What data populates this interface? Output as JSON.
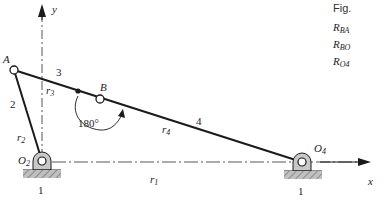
{
  "diagram": {
    "type": "four-bar linkage (vector loop)",
    "axes": {
      "x_label": "x",
      "y_label": "y"
    },
    "points": {
      "A": "A",
      "B": "B",
      "O2": {
        "base": "O",
        "sub": "2"
      },
      "O4": {
        "base": "O",
        "sub": "4"
      }
    },
    "links": {
      "ground": "1",
      "ground_right": "1",
      "crank": "2",
      "coupler": "3",
      "rocker": "4"
    },
    "vectors": {
      "r1": {
        "base": "r",
        "sub": "1"
      },
      "r2": {
        "base": "r",
        "sub": "2"
      },
      "r3": {
        "base": "r",
        "sub": "3"
      },
      "r4": {
        "base": "r",
        "sub": "4"
      }
    },
    "angle_annotation": "180°"
  },
  "side_text": {
    "fig_label": "Fig.",
    "lines": [
      {
        "base": "R",
        "sub": "BA"
      },
      {
        "base": "R",
        "sub": "BO"
      },
      {
        "base": "R",
        "sub": "O4"
      }
    ]
  },
  "colors": {
    "line": "#1a1a1a",
    "pivot_fill": "#c8c8c8",
    "ground_fill": "#b8b8b8",
    "axis": "#555555"
  }
}
